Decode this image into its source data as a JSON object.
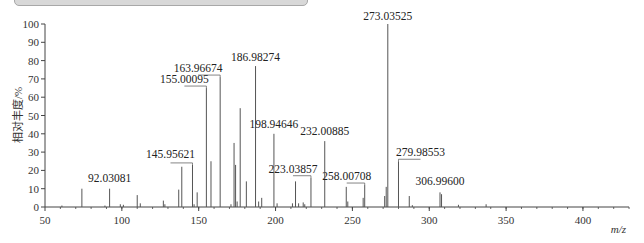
{
  "chart_data": {
    "type": "bar",
    "subtype": "mass-spectrum-stick",
    "title": "",
    "xlabel": "m/z",
    "ylabel": "相对丰度/%",
    "xlim": [
      50,
      430
    ],
    "ylim": [
      0,
      100
    ],
    "x_ticks": [
      50,
      100,
      150,
      200,
      250,
      300,
      350,
      400
    ],
    "y_ticks": [
      0,
      10,
      20,
      30,
      40,
      50,
      60,
      70,
      80,
      90,
      100
    ],
    "grid": false,
    "legend": null,
    "peaks": [
      {
        "mz": 61,
        "intensity": 0.8
      },
      {
        "mz": 74,
        "intensity": 10
      },
      {
        "mz": 89,
        "intensity": 0.8
      },
      {
        "mz": 92.03081,
        "intensity": 10,
        "label": "92.03081"
      },
      {
        "mz": 99,
        "intensity": 1.5
      },
      {
        "mz": 101,
        "intensity": 1.2
      },
      {
        "mz": 110,
        "intensity": 6.5
      },
      {
        "mz": 112,
        "intensity": 2
      },
      {
        "mz": 127,
        "intensity": 3.5
      },
      {
        "mz": 128,
        "intensity": 1.5
      },
      {
        "mz": 137,
        "intensity": 9.5
      },
      {
        "mz": 139,
        "intensity": 22
      },
      {
        "mz": 145.95621,
        "intensity": 23,
        "label": "145.95621"
      },
      {
        "mz": 147,
        "intensity": 1.5
      },
      {
        "mz": 149,
        "intensity": 8
      },
      {
        "mz": 155.00095,
        "intensity": 65,
        "label": "155.00095"
      },
      {
        "mz": 158,
        "intensity": 25
      },
      {
        "mz": 163.96674,
        "intensity": 71,
        "label": "163.96674"
      },
      {
        "mz": 171,
        "intensity": 1.5
      },
      {
        "mz": 173,
        "intensity": 35
      },
      {
        "mz": 174,
        "intensity": 23
      },
      {
        "mz": 175,
        "intensity": 3
      },
      {
        "mz": 177,
        "intensity": 54
      },
      {
        "mz": 181,
        "intensity": 14
      },
      {
        "mz": 186.98274,
        "intensity": 77,
        "label": "186.98274"
      },
      {
        "mz": 189,
        "intensity": 3
      },
      {
        "mz": 191,
        "intensity": 5
      },
      {
        "mz": 198.94646,
        "intensity": 40,
        "label": "198.94646"
      },
      {
        "mz": 201,
        "intensity": 2
      },
      {
        "mz": 211,
        "intensity": 2
      },
      {
        "mz": 213,
        "intensity": 14
      },
      {
        "mz": 215,
        "intensity": 2
      },
      {
        "mz": 218,
        "intensity": 2.5
      },
      {
        "mz": 219,
        "intensity": 1.5
      },
      {
        "mz": 223.03857,
        "intensity": 16,
        "label": "223.03857"
      },
      {
        "mz": 232.00885,
        "intensity": 36,
        "label": "232.00885"
      },
      {
        "mz": 246,
        "intensity": 11
      },
      {
        "mz": 247,
        "intensity": 3
      },
      {
        "mz": 257,
        "intensity": 5
      },
      {
        "mz": 258.00708,
        "intensity": 12,
        "label": "258.00708"
      },
      {
        "mz": 271,
        "intensity": 6
      },
      {
        "mz": 272,
        "intensity": 11
      },
      {
        "mz": 273.03525,
        "intensity": 100,
        "label": "273.03525"
      },
      {
        "mz": 279.98553,
        "intensity": 25,
        "label": "279.98553"
      },
      {
        "mz": 287,
        "intensity": 6
      },
      {
        "mz": 289,
        "intensity": 1
      },
      {
        "mz": 306.996,
        "intensity": 8,
        "label": "306.99600"
      },
      {
        "mz": 308,
        "intensity": 7
      },
      {
        "mz": 319,
        "intensity": 1.2
      },
      {
        "mz": 337,
        "intensity": 1.5
      }
    ]
  }
}
